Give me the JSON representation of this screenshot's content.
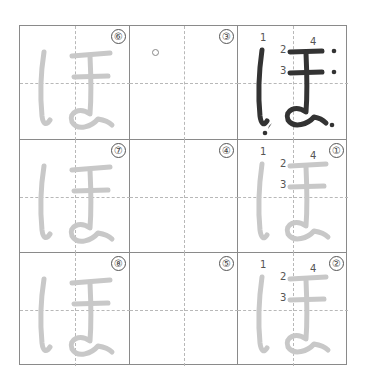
{
  "worksheet": {
    "character": "ほ",
    "grid": {
      "rows": 3,
      "cols": 3
    },
    "colors": {
      "border": "#8a8a8a",
      "guide": "#b8b8b8",
      "model_stroke": "#333333",
      "trace_stroke": "#c8c8c8",
      "badge": "#555555"
    },
    "cells": [
      {
        "row": 1,
        "col": 1,
        "badge": "⑥",
        "type": "trace"
      },
      {
        "row": 1,
        "col": 2,
        "badge": "③",
        "type": "blank-start",
        "start_marker": "○"
      },
      {
        "row": 1,
        "col": 3,
        "badge": "",
        "type": "model",
        "stroke_numbers": [
          "1",
          "2",
          "3",
          "4"
        ]
      },
      {
        "row": 2,
        "col": 1,
        "badge": "⑦",
        "type": "trace"
      },
      {
        "row": 2,
        "col": 2,
        "badge": "④",
        "type": "blank"
      },
      {
        "row": 2,
        "col": 3,
        "badge": "①",
        "type": "trace-numbered",
        "stroke_numbers": [
          "1",
          "2",
          "3",
          "4"
        ]
      },
      {
        "row": 3,
        "col": 1,
        "badge": "⑧",
        "type": "trace"
      },
      {
        "row": 3,
        "col": 2,
        "badge": "⑤",
        "type": "blank"
      },
      {
        "row": 3,
        "col": 3,
        "badge": "②",
        "type": "trace-numbered",
        "stroke_numbers": [
          "1",
          "2",
          "3",
          "4"
        ]
      }
    ]
  }
}
